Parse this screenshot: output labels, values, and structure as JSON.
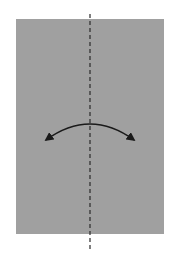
{
  "diagram": {
    "type": "origami-fold-step",
    "background": "#ffffff",
    "paper": {
      "x": 16,
      "y": 19,
      "width": 148,
      "height": 215,
      "fill": "#a0a0a0"
    },
    "fold_line": {
      "style": "valley-dashed",
      "x": 90,
      "y1": 14,
      "y2": 250,
      "color": "#2a2a2a"
    },
    "arrow": {
      "kind": "double-headed-curved",
      "color": "#1a1a1a",
      "start": [
        46,
        140
      ],
      "control": [
        90,
        108
      ],
      "end": [
        134,
        140
      ]
    }
  }
}
